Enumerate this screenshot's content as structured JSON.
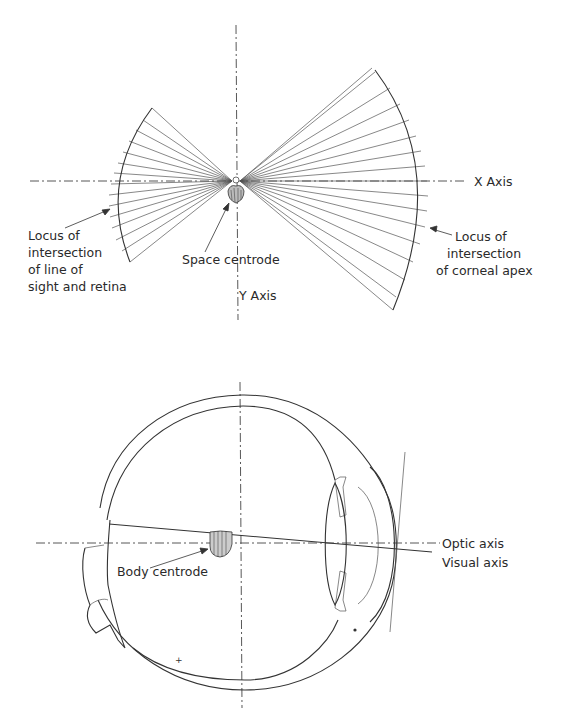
{
  "figure_top": {
    "labels": {
      "x_axis": "X Axis",
      "y_axis": "Y Axis",
      "space_centrode": "Space centrode",
      "left_locus": [
        "Locus of",
        "intersection",
        "of line of",
        "sight and retina"
      ],
      "right_locus": [
        "Locus of",
        "intersection",
        "of corneal apex"
      ]
    }
  },
  "figure_bottom": {
    "labels": {
      "body_centrode": "Body centrode",
      "optic_axis": "Optic axis",
      "visual_axis": "Visual axis"
    }
  },
  "colors": {
    "ink": "#2a2a2a",
    "background": "#ffffff"
  }
}
